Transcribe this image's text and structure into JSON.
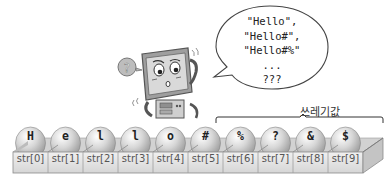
{
  "bubble": {
    "lines": [
      "\"Hello\",",
      "\"Hello#\",",
      "\"Hello#%\"",
      "...",
      "???"
    ]
  },
  "character": {
    "description": "confused computer monitor mascot with question mark",
    "question_mark": "?"
  },
  "garbage": {
    "label": "쓰레기값"
  },
  "array": {
    "cells": [
      {
        "value": "H",
        "index_label": "str[0]"
      },
      {
        "value": "e",
        "index_label": "str[1]"
      },
      {
        "value": "l",
        "index_label": "str[2]"
      },
      {
        "value": "l",
        "index_label": "str[3]"
      },
      {
        "value": "o",
        "index_label": "str[4]"
      },
      {
        "value": "#",
        "index_label": "str[5]"
      },
      {
        "value": "%",
        "index_label": "str[6]"
      },
      {
        "value": "?",
        "index_label": "str[7]"
      },
      {
        "value": "&",
        "index_label": "str[8]"
      },
      {
        "value": "$",
        "index_label": "str[9]"
      }
    ]
  },
  "colors": {
    "tray_face": "#e4e4e4",
    "tray_top": "#cfcfcf",
    "ball": "#c8c8c8",
    "outline": "#8a8a8a"
  }
}
